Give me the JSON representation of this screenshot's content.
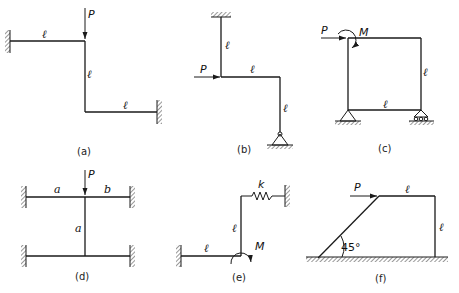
{
  "figure": {
    "panels": [
      {
        "id": "a",
        "caption": "(a)",
        "load_label": "P",
        "member_labels": [
          "ℓ",
          "ℓ",
          "ℓ"
        ],
        "supports": [
          "fixed-left",
          "fixed-right"
        ]
      },
      {
        "id": "b",
        "caption": "(b)",
        "load_label": "P",
        "member_labels": [
          "ℓ",
          "ℓ",
          "ℓ"
        ],
        "supports": [
          "fixed-top",
          "pin-bottom"
        ]
      },
      {
        "id": "c",
        "caption": "(c)",
        "load_label": "P",
        "moment_label": "M",
        "member_labels": [
          "ℓ",
          "ℓ"
        ],
        "supports": [
          "pin",
          "roller"
        ]
      },
      {
        "id": "d",
        "caption": "(d)",
        "load_label": "P",
        "member_labels": [
          "a",
          "b",
          "a"
        ],
        "supports": [
          "fixed",
          "fixed",
          "fixed",
          "fixed"
        ]
      },
      {
        "id": "e",
        "caption": "(e)",
        "moment_label": "M",
        "spring_label": "k",
        "member_labels": [
          "ℓ",
          "ℓ"
        ],
        "supports": [
          "fixed-left",
          "spring-to-wall"
        ]
      },
      {
        "id": "f",
        "caption": "(f)",
        "load_label": "P",
        "angle_label": "45°",
        "member_labels": [
          "ℓ",
          "ℓ"
        ],
        "supports": [
          "ground"
        ]
      }
    ]
  }
}
